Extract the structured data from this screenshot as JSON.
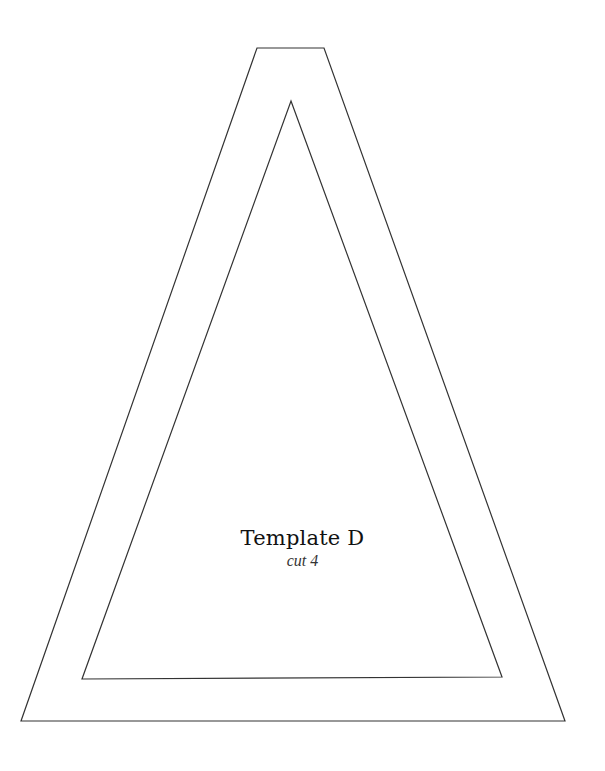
{
  "template": {
    "title": "Template D",
    "subtitle": "cut 4"
  },
  "shapes": {
    "outer_points": "257,48 324,48 565,721 21,721",
    "inner_points": "291,101 502,677 82,679",
    "stroke_color": "#333333"
  }
}
